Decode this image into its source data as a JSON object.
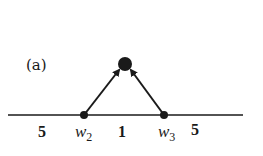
{
  "figure": {
    "panel_label": "(a)",
    "colors": {
      "ink": "#1a1a1a",
      "background": "#ffffff"
    },
    "baseline": {
      "x1": 8,
      "x2": 243,
      "y": 115
    },
    "nodes": [
      {
        "id": "w2",
        "x": 84,
        "y": 115,
        "r": 4
      },
      {
        "id": "w3",
        "x": 164,
        "y": 115,
        "r": 4
      },
      {
        "id": "top",
        "x": 125,
        "y": 64,
        "r": 7
      }
    ],
    "edges": [
      {
        "from": "w2",
        "to": "top",
        "directed": true
      },
      {
        "from": "w3",
        "to": "top",
        "directed": true
      }
    ],
    "labels": {
      "weight_left": "5",
      "node_w2_base": "w",
      "node_w2_sub": "2",
      "weight_middle": "1",
      "node_w3_base": "w",
      "node_w3_sub": "3",
      "weight_right": "5"
    }
  }
}
